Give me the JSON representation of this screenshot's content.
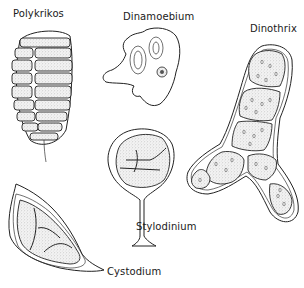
{
  "figure": {
    "type": "scientific line-drawing illustration",
    "background": "#ffffff",
    "ink_color": "#222222"
  },
  "specimens": [
    {
      "id": "polykrikos",
      "label": "Polykrikos",
      "description": "segmented oval colony with transverse girdle rows and trailing flagellum"
    },
    {
      "id": "dinamoebium",
      "label": "Dinamoebium",
      "description": "amoeboid cell with pseudopodia, two oval vacuoles and a nucleus"
    },
    {
      "id": "dinothrix",
      "label": "Dinothrix",
      "description": "branched filament of stippled cells with double wall"
    },
    {
      "id": "stylodinium",
      "label": "Stylodinium",
      "description": "spherical cell on a stalk with flared base"
    },
    {
      "id": "cystodium",
      "label": "Cystodium",
      "description": "crescent-shaped cyst with pointed ends enclosing stippled protoplast"
    }
  ]
}
